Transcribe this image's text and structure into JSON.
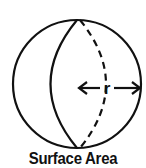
{
  "figure": {
    "caption": "Surface Area",
    "radius_label": "r",
    "stroke_color": "#111111",
    "background": "#ffffff",
    "shape": "sphere",
    "elements": [
      "outer-circle",
      "front-meridian-solid",
      "back-meridian-dashed",
      "radius-arrow-left",
      "radius-arrow-right"
    ]
  }
}
